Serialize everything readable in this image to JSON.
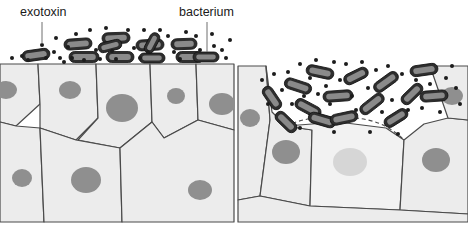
{
  "figure": {
    "type": "biological-diagram",
    "panel_count": 2,
    "background_color": "#ffffff"
  },
  "labels": {
    "exotoxin": "exotoxin",
    "bacterium": "bacterium"
  },
  "colors": {
    "cell_fill": "#ececec",
    "cell_stroke": "#4a4a4a",
    "nucleus_fill": "#8f8f8f",
    "nucleus_damaged_fill": "#d6d6d6",
    "damaged_cell_fill": "#f2f2f2",
    "bacterium_fill": "#2e2e2e",
    "bacterium_highlight": "#8a8a8a",
    "toxin_dot": "#1c1c1c",
    "leader_line": "#6e6e6e",
    "label_text": "#1a1a1a"
  },
  "left_panel": {
    "caption_role": "intact epithelium with bacteria and exotoxin on the surface",
    "surface_y": 63,
    "surface_intact": true,
    "cells": [
      {
        "id": "L1",
        "points": "0,64 38,64 40,104 16,126 0,122",
        "nucleus": {
          "cx": 6,
          "cy": 90,
          "rx": 11,
          "ry": 9
        }
      },
      {
        "id": "L2",
        "points": "38,64 96,64 98,118 76,140 40,128 40,104",
        "nucleus": {
          "cx": 70,
          "cy": 90,
          "rx": 11,
          "ry": 9
        }
      },
      {
        "id": "L3",
        "points": "96,64 150,64 152,122 120,148 78,140 98,118",
        "nucleus": {
          "cx": 122,
          "cy": 108,
          "rx": 16,
          "ry": 14
        }
      },
      {
        "id": "L4",
        "points": "150,64 196,64 198,120 164,138 152,122",
        "nucleus": {
          "cx": 176,
          "cy": 96,
          "rx": 9,
          "ry": 8
        }
      },
      {
        "id": "L5",
        "points": "196,64 234,64 234,130 198,120",
        "nucleus": {
          "cx": 222,
          "cy": 104,
          "rx": 13,
          "ry": 11
        }
      },
      {
        "id": "L6",
        "points": "0,122 16,126 40,128 44,222 0,222",
        "nucleus": {
          "cx": 22,
          "cy": 178,
          "rx": 10,
          "ry": 9
        }
      },
      {
        "id": "L7",
        "points": "40,128 76,140 120,148 122,222 44,222",
        "nucleus": {
          "cx": 86,
          "cy": 180,
          "rx": 15,
          "ry": 13
        }
      },
      {
        "id": "L8",
        "points": "120,148 152,122 164,138 198,120 234,130 234,222 122,222",
        "nucleus": {
          "cx": 200,
          "cy": 190,
          "rx": 12,
          "ry": 10
        }
      }
    ],
    "bacteria": [
      {
        "x": 36,
        "y": 55,
        "w": 28,
        "h": 11,
        "rot": -8
      },
      {
        "x": 78,
        "y": 44,
        "w": 28,
        "h": 11,
        "rot": -4
      },
      {
        "x": 84,
        "y": 57,
        "w": 30,
        "h": 11,
        "rot": 0
      },
      {
        "x": 116,
        "y": 38,
        "w": 28,
        "h": 11,
        "rot": -2
      },
      {
        "x": 120,
        "y": 57,
        "w": 28,
        "h": 11,
        "rot": 0
      },
      {
        "x": 110,
        "y": 46,
        "w": 24,
        "h": 10,
        "rot": -14
      },
      {
        "x": 150,
        "y": 45,
        "w": 28,
        "h": 11,
        "rot": -3
      },
      {
        "x": 152,
        "y": 58,
        "w": 26,
        "h": 10,
        "rot": 0
      },
      {
        "x": 152,
        "y": 43,
        "w": 22,
        "h": 10,
        "rot": -62
      },
      {
        "x": 184,
        "y": 44,
        "w": 26,
        "h": 11,
        "rot": -2
      },
      {
        "x": 190,
        "y": 57,
        "w": 28,
        "h": 11,
        "rot": 0
      },
      {
        "x": 206,
        "y": 57,
        "w": 26,
        "h": 10,
        "rot": 0
      }
    ],
    "toxin_dots": [
      {
        "x": 12,
        "y": 58,
        "r": 2
      },
      {
        "x": 22,
        "y": 56,
        "r": 2
      },
      {
        "x": 28,
        "y": 60,
        "r": 2
      },
      {
        "x": 42,
        "y": 45,
        "r": 2
      },
      {
        "x": 46,
        "y": 58,
        "r": 2
      },
      {
        "x": 54,
        "y": 52,
        "r": 2
      },
      {
        "x": 60,
        "y": 58,
        "r": 2
      },
      {
        "x": 56,
        "y": 38,
        "r": 2
      },
      {
        "x": 68,
        "y": 47,
        "r": 2
      },
      {
        "x": 72,
        "y": 58,
        "r": 2
      },
      {
        "x": 76,
        "y": 34,
        "r": 2
      },
      {
        "x": 90,
        "y": 30,
        "r": 2
      },
      {
        "x": 96,
        "y": 50,
        "r": 2
      },
      {
        "x": 100,
        "y": 59,
        "r": 2
      },
      {
        "x": 106,
        "y": 28,
        "r": 2
      },
      {
        "x": 112,
        "y": 51,
        "r": 2
      },
      {
        "x": 116,
        "y": 59,
        "r": 2
      },
      {
        "x": 128,
        "y": 30,
        "r": 2
      },
      {
        "x": 134,
        "y": 48,
        "r": 2
      },
      {
        "x": 140,
        "y": 58,
        "r": 2
      },
      {
        "x": 144,
        "y": 30,
        "r": 2
      },
      {
        "x": 148,
        "y": 52,
        "r": 2
      },
      {
        "x": 160,
        "y": 30,
        "r": 2
      },
      {
        "x": 168,
        "y": 36,
        "r": 2
      },
      {
        "x": 174,
        "y": 52,
        "r": 2
      },
      {
        "x": 180,
        "y": 59,
        "r": 2
      },
      {
        "x": 186,
        "y": 32,
        "r": 2
      },
      {
        "x": 196,
        "y": 36,
        "r": 2
      },
      {
        "x": 200,
        "y": 50,
        "r": 2
      },
      {
        "x": 212,
        "y": 34,
        "r": 2
      },
      {
        "x": 214,
        "y": 46,
        "r": 2
      },
      {
        "x": 222,
        "y": 50,
        "r": 2
      },
      {
        "x": 226,
        "y": 58,
        "r": 2
      },
      {
        "x": 230,
        "y": 40,
        "r": 2
      },
      {
        "x": 84,
        "y": 60,
        "r": 2
      },
      {
        "x": 64,
        "y": 62,
        "r": 2
      }
    ]
  },
  "right_panel": {
    "caption_role": "epithelium damaged by exotoxin; bacteria penetrate eroded surface and a lysed cell appears",
    "surface_eroded": true,
    "cells": [
      {
        "id": "R1",
        "points": "238,66 266,66 270,120 260,196 238,200",
        "nucleus": {
          "cx": 250,
          "cy": 118,
          "rx": 10,
          "ry": 9
        }
      },
      {
        "id": "R2",
        "points": "266,66 272,112 286,126 312,130 310,206 260,196 270,120",
        "nucleus": {
          "cx": 286,
          "cy": 152,
          "rx": 14,
          "ry": 12
        }
      },
      {
        "id": "R3",
        "points": "286,126 338,122 386,128 404,140 400,210 310,206 312,130",
        "nucleus": {
          "cx": 350,
          "cy": 162,
          "rx": 17,
          "ry": 14
        },
        "damaged": true
      },
      {
        "id": "R4",
        "points": "404,140 424,124 448,118 468,120 468,214 400,210",
        "nucleus": {
          "cx": 436,
          "cy": 160,
          "rx": 14,
          "ry": 12
        }
      },
      {
        "id": "R5",
        "points": "430,66 448,118 468,120 468,66",
        "nucleus": {
          "cx": 452,
          "cy": 96,
          "rx": 11,
          "ry": 9
        }
      },
      {
        "id": "R6",
        "points": "238,200 260,196 310,206 400,210 468,214 468,222 238,222",
        "nucleus": null
      }
    ],
    "damaged_cell_id": "R3",
    "dashed_membrane": "M286,126 C306,116 340,114 368,120 C382,123 394,130 404,140",
    "bacteria": [
      {
        "x": 272,
        "y": 98,
        "w": 26,
        "h": 11,
        "rot": 56
      },
      {
        "x": 286,
        "y": 122,
        "w": 26,
        "h": 11,
        "rot": 44
      },
      {
        "x": 298,
        "y": 86,
        "w": 28,
        "h": 11,
        "rot": 18
      },
      {
        "x": 308,
        "y": 108,
        "w": 28,
        "h": 11,
        "rot": 28
      },
      {
        "x": 320,
        "y": 72,
        "w": 28,
        "h": 11,
        "rot": 12
      },
      {
        "x": 322,
        "y": 120,
        "w": 28,
        "h": 11,
        "rot": 16
      },
      {
        "x": 338,
        "y": 96,
        "w": 30,
        "h": 11,
        "rot": -4
      },
      {
        "x": 344,
        "y": 118,
        "w": 28,
        "h": 11,
        "rot": -12
      },
      {
        "x": 356,
        "y": 76,
        "w": 26,
        "h": 11,
        "rot": -26
      },
      {
        "x": 372,
        "y": 104,
        "w": 28,
        "h": 11,
        "rot": -38
      },
      {
        "x": 386,
        "y": 82,
        "w": 28,
        "h": 11,
        "rot": -36
      },
      {
        "x": 396,
        "y": 118,
        "w": 26,
        "h": 11,
        "rot": -32
      },
      {
        "x": 412,
        "y": 94,
        "w": 26,
        "h": 11,
        "rot": -44
      },
      {
        "x": 424,
        "y": 70,
        "w": 28,
        "h": 11,
        "rot": -8
      },
      {
        "x": 434,
        "y": 96,
        "w": 28,
        "h": 11,
        "rot": -4
      }
    ],
    "toxin_dots": [
      {
        "x": 262,
        "y": 80,
        "r": 2
      },
      {
        "x": 274,
        "y": 74,
        "r": 2
      },
      {
        "x": 282,
        "y": 90,
        "r": 2
      },
      {
        "x": 288,
        "y": 72,
        "r": 2
      },
      {
        "x": 292,
        "y": 104,
        "r": 2
      },
      {
        "x": 300,
        "y": 64,
        "r": 2
      },
      {
        "x": 304,
        "y": 96,
        "r": 2
      },
      {
        "x": 310,
        "y": 78,
        "r": 2
      },
      {
        "x": 316,
        "y": 60,
        "r": 2
      },
      {
        "x": 318,
        "y": 94,
        "r": 2
      },
      {
        "x": 326,
        "y": 86,
        "r": 2
      },
      {
        "x": 330,
        "y": 104,
        "r": 2
      },
      {
        "x": 334,
        "y": 62,
        "r": 2
      },
      {
        "x": 340,
        "y": 80,
        "r": 2
      },
      {
        "x": 346,
        "y": 64,
        "r": 2
      },
      {
        "x": 352,
        "y": 96,
        "r": 2
      },
      {
        "x": 356,
        "y": 110,
        "r": 2
      },
      {
        "x": 362,
        "y": 62,
        "r": 2
      },
      {
        "x": 368,
        "y": 88,
        "r": 2
      },
      {
        "x": 376,
        "y": 70,
        "r": 2
      },
      {
        "x": 382,
        "y": 112,
        "r": 2
      },
      {
        "x": 388,
        "y": 66,
        "r": 2
      },
      {
        "x": 392,
        "y": 100,
        "r": 2
      },
      {
        "x": 402,
        "y": 74,
        "r": 2
      },
      {
        "x": 408,
        "y": 110,
        "r": 2
      },
      {
        "x": 416,
        "y": 80,
        "r": 2
      },
      {
        "x": 422,
        "y": 108,
        "r": 2
      },
      {
        "x": 430,
        "y": 84,
        "r": 2
      },
      {
        "x": 440,
        "y": 112,
        "r": 2
      },
      {
        "x": 446,
        "y": 78,
        "r": 2
      },
      {
        "x": 456,
        "y": 88,
        "r": 2
      },
      {
        "x": 460,
        "y": 104,
        "r": 2
      },
      {
        "x": 268,
        "y": 104,
        "r": 2
      },
      {
        "x": 300,
        "y": 128,
        "r": 2
      },
      {
        "x": 334,
        "y": 132,
        "r": 2
      },
      {
        "x": 370,
        "y": 132,
        "r": 2
      },
      {
        "x": 398,
        "y": 134,
        "r": 2
      },
      {
        "x": 452,
        "y": 66,
        "r": 2
      }
    ]
  },
  "annotations": [
    {
      "name": "exotoxin",
      "text_x": 20,
      "text_y": 16,
      "line": "M42,22 L42,44"
    },
    {
      "name": "bacterium",
      "text_x": 179,
      "text_y": 16,
      "line": "M207,22 L207,52"
    }
  ]
}
